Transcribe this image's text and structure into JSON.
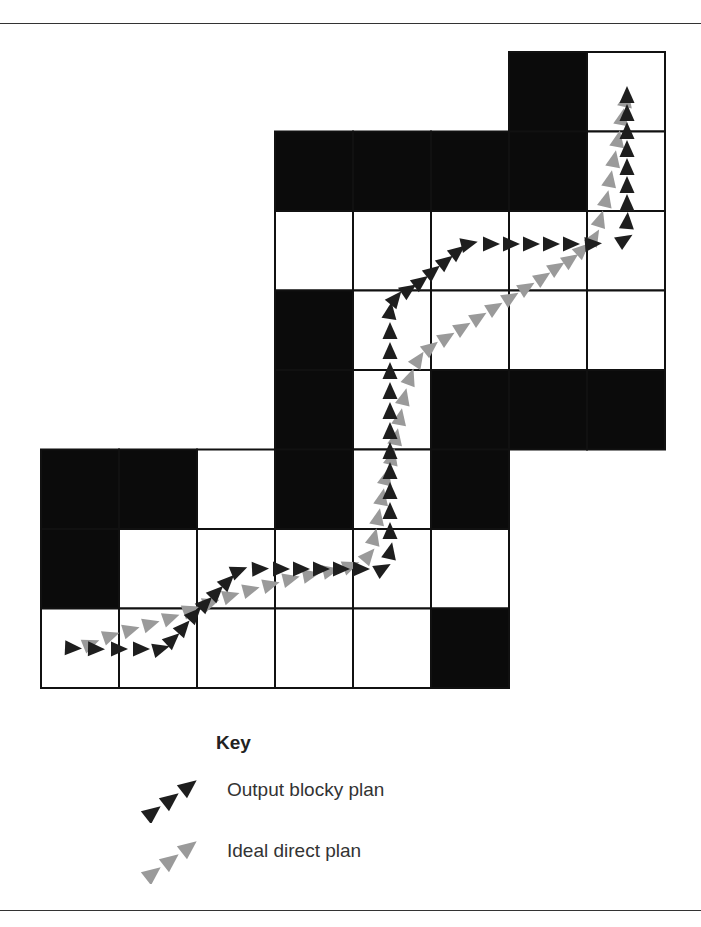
{
  "figure": {
    "grid": {
      "origin_x": 41,
      "origin_y": 52,
      "cell_w": 78,
      "cell_h": 79.5,
      "cells": [
        {
          "r": 0,
          "c": 6,
          "fill": "black"
        },
        {
          "r": 0,
          "c": 7,
          "fill": "white"
        },
        {
          "r": 1,
          "c": 3,
          "fill": "black"
        },
        {
          "r": 1,
          "c": 4,
          "fill": "black"
        },
        {
          "r": 1,
          "c": 5,
          "fill": "black"
        },
        {
          "r": 1,
          "c": 6,
          "fill": "black"
        },
        {
          "r": 1,
          "c": 7,
          "fill": "white"
        },
        {
          "r": 2,
          "c": 3,
          "fill": "white"
        },
        {
          "r": 2,
          "c": 4,
          "fill": "white"
        },
        {
          "r": 2,
          "c": 5,
          "fill": "white"
        },
        {
          "r": 2,
          "c": 6,
          "fill": "white"
        },
        {
          "r": 2,
          "c": 7,
          "fill": "white"
        },
        {
          "r": 3,
          "c": 3,
          "fill": "black"
        },
        {
          "r": 3,
          "c": 4,
          "fill": "white"
        },
        {
          "r": 3,
          "c": 5,
          "fill": "white"
        },
        {
          "r": 3,
          "c": 6,
          "fill": "white"
        },
        {
          "r": 3,
          "c": 7,
          "fill": "white"
        },
        {
          "r": 4,
          "c": 3,
          "fill": "black"
        },
        {
          "r": 4,
          "c": 4,
          "fill": "white"
        },
        {
          "r": 4,
          "c": 5,
          "fill": "black"
        },
        {
          "r": 4,
          "c": 6,
          "fill": "black"
        },
        {
          "r": 4,
          "c": 7,
          "fill": "black"
        },
        {
          "r": 5,
          "c": 0,
          "fill": "black"
        },
        {
          "r": 5,
          "c": 1,
          "fill": "black"
        },
        {
          "r": 5,
          "c": 2,
          "fill": "white"
        },
        {
          "r": 5,
          "c": 3,
          "fill": "black"
        },
        {
          "r": 5,
          "c": 4,
          "fill": "white"
        },
        {
          "r": 5,
          "c": 5,
          "fill": "black"
        },
        {
          "r": 6,
          "c": 0,
          "fill": "black"
        },
        {
          "r": 6,
          "c": 1,
          "fill": "white"
        },
        {
          "r": 6,
          "c": 2,
          "fill": "white"
        },
        {
          "r": 6,
          "c": 3,
          "fill": "white"
        },
        {
          "r": 6,
          "c": 4,
          "fill": "white"
        },
        {
          "r": 6,
          "c": 5,
          "fill": "white"
        },
        {
          "r": 7,
          "c": 0,
          "fill": "white"
        },
        {
          "r": 7,
          "c": 1,
          "fill": "white"
        },
        {
          "r": 7,
          "c": 2,
          "fill": "white"
        },
        {
          "r": 7,
          "c": 3,
          "fill": "white"
        },
        {
          "r": 7,
          "c": 4,
          "fill": "white"
        },
        {
          "r": 7,
          "c": 5,
          "fill": "black"
        }
      ]
    },
    "paths": [
      {
        "name": "output-blocky-plan",
        "color": "#1e1e1e",
        "points": [
          [
            72,
            648
          ],
          [
            95,
            649
          ],
          [
            118,
            649
          ],
          [
            140,
            649
          ],
          [
            160,
            649
          ],
          [
            172,
            640
          ],
          [
            183,
            628
          ],
          [
            194,
            615
          ],
          [
            205,
            604
          ],
          [
            216,
            593
          ],
          [
            227,
            582
          ],
          [
            238,
            571
          ],
          [
            259,
            569
          ],
          [
            280,
            569
          ],
          [
            300,
            569
          ],
          [
            320,
            569
          ],
          [
            340,
            569
          ],
          [
            360,
            569
          ],
          [
            382,
            569
          ],
          [
            390,
            552
          ],
          [
            390,
            532
          ],
          [
            390,
            512
          ],
          [
            390,
            492
          ],
          [
            390,
            472
          ],
          [
            390,
            452
          ],
          [
            390,
            432
          ],
          [
            390,
            412
          ],
          [
            390,
            392
          ],
          [
            390,
            372
          ],
          [
            390,
            352
          ],
          [
            390,
            332
          ],
          [
            390,
            312
          ],
          [
            395,
            299
          ],
          [
            408,
            290
          ],
          [
            420,
            282
          ],
          [
            432,
            272
          ],
          [
            445,
            262
          ],
          [
            457,
            252
          ],
          [
            468,
            244
          ],
          [
            490,
            244
          ],
          [
            510,
            244
          ],
          [
            530,
            244
          ],
          [
            550,
            244
          ],
          [
            570,
            244
          ],
          [
            592,
            244
          ],
          [
            624,
            240
          ],
          [
            627,
            222
          ],
          [
            627,
            204
          ],
          [
            627,
            186
          ],
          [
            627,
            168
          ],
          [
            627,
            150
          ],
          [
            627,
            132
          ],
          [
            627,
            114
          ],
          [
            627,
            96
          ]
        ]
      },
      {
        "name": "ideal-direct-plan",
        "color": "#9a9a9a",
        "points": [
          [
            90,
            644
          ],
          [
            110,
            636
          ],
          [
            130,
            630
          ],
          [
            150,
            624
          ],
          [
            170,
            618
          ],
          [
            190,
            610
          ],
          [
            210,
            603
          ],
          [
            230,
            596
          ],
          [
            250,
            590
          ],
          [
            270,
            585
          ],
          [
            290,
            579
          ],
          [
            310,
            575
          ],
          [
            330,
            571
          ],
          [
            350,
            566
          ],
          [
            368,
            556
          ],
          [
            374,
            538
          ],
          [
            378,
            518
          ],
          [
            382,
            498
          ],
          [
            386,
            478
          ],
          [
            392,
            458
          ],
          [
            396,
            438
          ],
          [
            400,
            418
          ],
          [
            404,
            398
          ],
          [
            410,
            378
          ],
          [
            418,
            360
          ],
          [
            430,
            348
          ],
          [
            446,
            338
          ],
          [
            462,
            328
          ],
          [
            478,
            318
          ],
          [
            494,
            308
          ],
          [
            510,
            298
          ],
          [
            526,
            288
          ],
          [
            542,
            278
          ],
          [
            556,
            268
          ],
          [
            570,
            260
          ],
          [
            582,
            250
          ],
          [
            594,
            238
          ],
          [
            600,
            220
          ],
          [
            606,
            200
          ],
          [
            610,
            180
          ],
          [
            614,
            160
          ],
          [
            618,
            140
          ],
          [
            622,
            118
          ],
          [
            626,
            100
          ]
        ]
      }
    ]
  },
  "key": {
    "title": "Key",
    "items": [
      {
        "label": "Output blocky plan",
        "color": "#1e1e1e"
      },
      {
        "label": "Ideal direct plan",
        "color": "#9a9a9a"
      }
    ]
  }
}
